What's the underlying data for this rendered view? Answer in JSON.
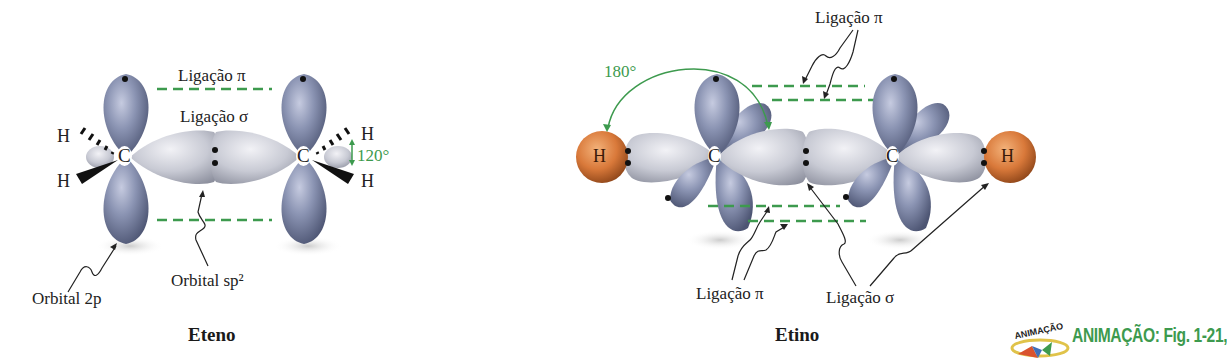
{
  "eteno": {
    "caption": "Eteno",
    "labels": {
      "pi_bond": "Ligação π",
      "sigma_bond": "Ligação σ",
      "angle": "120°",
      "orbital_2p": "Orbital 2p",
      "orbital_sp2": "Orbital sp²",
      "carbon_left": "C",
      "carbon_right": "C",
      "h_top_left": "H",
      "h_bottom_left": "H",
      "h_top_right": "H",
      "h_bottom_right": "H"
    }
  },
  "etino": {
    "caption": "Etino",
    "labels": {
      "pi_bond_top": "Ligação π",
      "pi_bond_bottom": "Ligação π",
      "sigma_bond": "Ligação σ",
      "angle": "180°",
      "carbon_left": "C",
      "carbon_right": "C",
      "h_left": "H",
      "h_right": "H"
    }
  },
  "animation": {
    "logo_text": "ANIMAÇÃO",
    "link_text": "ANIMAÇÃO: Fig. 1-21,"
  },
  "colors": {
    "p_orbital": "#8a93b0",
    "sp_orbital": "#c8cad4",
    "hydrogen": "#d9793a",
    "bond_dash": "#3d9a4e",
    "angle_annotation": "#3d9a4e"
  }
}
